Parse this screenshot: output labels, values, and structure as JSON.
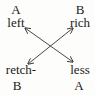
{
  "diagram": {
    "nodes": {
      "top_left": {
        "tag": "A",
        "word": "left"
      },
      "top_right": {
        "tag": "B",
        "word": "rich"
      },
      "bottom_left": {
        "word": "retch-",
        "tag": "B"
      },
      "bottom_right": {
        "word": "less",
        "tag": "A"
      }
    },
    "edges": [
      {
        "from": "top_left",
        "to": "bottom_right",
        "type": "double-arrow"
      },
      {
        "from": "top_right",
        "to": "bottom_left",
        "type": "double-arrow"
      }
    ],
    "colors": {
      "background": "#fdfdfb",
      "text": "#1a1a1a",
      "line": "#333333"
    }
  }
}
